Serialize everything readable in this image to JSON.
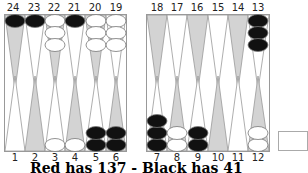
{
  "board": {
    "top_point_numbers": [
      "24",
      "23",
      "22",
      "21",
      "20",
      "19",
      "18",
      "17",
      "16",
      "15",
      "14",
      "13"
    ],
    "bottom_point_numbers": [
      "1",
      "2",
      "3",
      "4",
      "5",
      "6",
      "7",
      "8",
      "9",
      "10",
      "11",
      "12"
    ],
    "colors": {
      "point_shaded": "#d3d3d3",
      "point_plain": "#ffffff",
      "black_checker": "#111111",
      "white_checker": "#ffffff",
      "line": "#888888"
    },
    "checkers": {
      "24": {
        "color": "black",
        "count": 1
      },
      "23": {
        "color": "black",
        "count": 1
      },
      "22": {
        "color": "white",
        "count": 3
      },
      "21": {
        "color": "black",
        "count": 1
      },
      "20": {
        "color": "white",
        "count": 3
      },
      "19": {
        "color": "white",
        "count": 3
      },
      "13": {
        "color": "black",
        "count": 3
      },
      "3": {
        "color": "white",
        "count": 1
      },
      "4": {
        "color": "white",
        "count": 1
      },
      "5": {
        "color": "black",
        "count": 2
      },
      "6": {
        "color": "black",
        "count": 2
      },
      "7": {
        "color": "black",
        "count": 3
      },
      "8": {
        "color": "white",
        "count": 2
      },
      "9": {
        "color": "black",
        "count": 2
      },
      "12": {
        "color": "white",
        "count": 2
      }
    }
  },
  "status": {
    "text": "Red has 137 - Black has 41"
  }
}
